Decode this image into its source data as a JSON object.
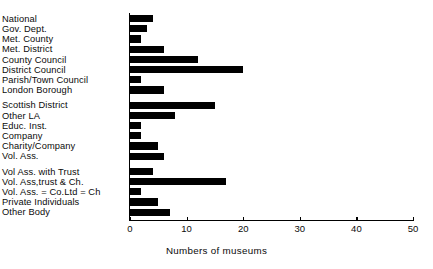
{
  "chart_data": {
    "type": "bar",
    "orientation": "horizontal",
    "title": "",
    "xlabel": "Numbers of museums",
    "ylabel": "",
    "xlim": [
      0,
      50
    ],
    "xticks": [
      0,
      10,
      20,
      30,
      40,
      50
    ],
    "xtick_labels": [
      "0",
      "10",
      "20",
      "30",
      "40",
      "50"
    ],
    "grid": false,
    "legend": null,
    "bar_color": "#000000",
    "axis_color": "#000000",
    "categories": [
      "National",
      "Gov. Dept.",
      "Met. County",
      "Met. District",
      "County Council",
      "District Council",
      "Parish/Town Council",
      "London Borough",
      "Scottish District",
      "Other LA",
      "Educ. Inst.",
      "Company",
      "Charity/Company",
      "Vol. Ass.",
      "Vol Ass. with Trust",
      "Vol. Ass,trust & Ch.",
      "Vol. Ass. = Co.Ltd = Ch",
      "Private Individuals",
      "Other Body"
    ],
    "values": [
      4,
      3,
      2,
      6,
      12,
      20,
      2,
      6,
      15,
      8,
      2,
      2,
      5,
      6,
      4,
      17,
      2,
      5,
      7
    ],
    "group_breaks_after": [
      "London Borough",
      "Vol. Ass."
    ]
  }
}
